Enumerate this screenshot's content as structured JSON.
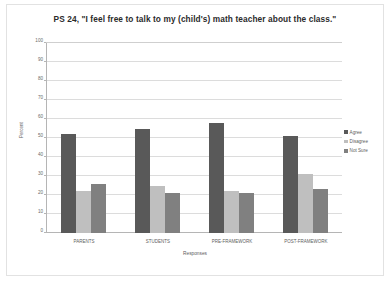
{
  "chart_data": {
    "type": "bar",
    "title": "PS 24, \"I feel free to talk to my (child's) math teacher about the class.\"",
    "xlabel": "Responses",
    "ylabel": "Percent",
    "categories": [
      "PARENTS",
      "STUDENTS",
      "PRE-FRAMEWORK",
      "POST-FRAMEWORK"
    ],
    "series": [
      {
        "name": "Agree",
        "values": [
          52,
          55,
          58,
          51
        ],
        "color": "#595959"
      },
      {
        "name": "Disagree",
        "values": [
          22,
          25,
          22,
          31
        ],
        "color": "#bfbfbf"
      },
      {
        "name": "Not Sure",
        "values": [
          26,
          21,
          21,
          23
        ],
        "color": "#808080"
      }
    ],
    "ylim": [
      0,
      100
    ],
    "yticks": [
      0,
      10,
      20,
      30,
      40,
      50,
      60,
      70,
      80,
      90,
      100
    ],
    "ytick_labels": [
      "0",
      "10",
      "20",
      "30",
      "40",
      "50",
      "60",
      "70",
      "80",
      "90",
      "100"
    ],
    "grid": true,
    "legend_position": "right"
  },
  "colors": {
    "agree": "#595959",
    "disagree": "#bfbfbf",
    "not_sure": "#808080",
    "gridline": "#dcdcdc",
    "axis": "#b5b5b5",
    "frame_border": "#e2e2e2",
    "title_text": "#2b2b2b",
    "label_text": "#5d5d5d"
  }
}
